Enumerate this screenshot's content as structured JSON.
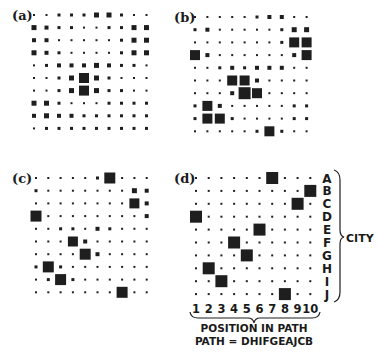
{
  "figure": {
    "panels": [
      {
        "id": "a",
        "label": "(a)",
        "label_pos": [
          12,
          20
        ],
        "origin": [
          34,
          15
        ],
        "step": [
          12.5,
          12.6
        ],
        "sizes": [
          [
            2,
            2,
            3,
            3,
            3,
            5,
            5,
            3,
            2,
            2
          ],
          [
            5,
            4,
            3,
            3,
            2,
            2,
            3,
            3,
            5,
            5
          ],
          [
            4,
            4,
            2,
            2,
            2,
            2,
            2,
            3,
            5,
            5
          ],
          [
            5,
            4,
            3,
            2,
            2,
            2,
            2,
            3,
            5,
            5
          ],
          [
            2,
            3,
            4,
            4,
            4,
            5,
            4,
            3,
            3,
            2
          ],
          [
            2,
            2,
            3,
            5,
            10,
            5,
            3,
            2,
            2,
            2
          ],
          [
            2,
            2,
            3,
            5,
            10,
            5,
            3,
            3,
            2,
            2
          ],
          [
            5,
            5,
            3,
            2,
            2,
            2,
            3,
            3,
            3,
            3
          ],
          [
            4,
            5,
            4,
            4,
            3,
            3,
            3,
            3,
            3,
            3
          ],
          [
            2,
            3,
            3,
            3,
            3,
            3,
            3,
            3,
            3,
            3
          ]
        ]
      },
      {
        "id": "b",
        "label": "(b)",
        "label_pos": [
          174,
          22
        ],
        "origin": [
          195,
          17
        ],
        "step": [
          12.4,
          12.7
        ],
        "sizes": [
          [
            2,
            2,
            2,
            2,
            2,
            3,
            4,
            4,
            2,
            2
          ],
          [
            3,
            4,
            2,
            2,
            2,
            2,
            2,
            3,
            5,
            5
          ],
          [
            2,
            2,
            2,
            2,
            2,
            2,
            2,
            3,
            10,
            10
          ],
          [
            10,
            4,
            2,
            2,
            2,
            2,
            2,
            2,
            4,
            10
          ],
          [
            2,
            2,
            3,
            4,
            3,
            4,
            4,
            4,
            2,
            2
          ],
          [
            2,
            2,
            2,
            10,
            10,
            4,
            2,
            2,
            2,
            2
          ],
          [
            2,
            2,
            2,
            4,
            12,
            10,
            2,
            2,
            2,
            2
          ],
          [
            3,
            10,
            4,
            2,
            2,
            2,
            2,
            2,
            3,
            3
          ],
          [
            3,
            10,
            10,
            3,
            2,
            2,
            2,
            2,
            3,
            3
          ],
          [
            2,
            2,
            2,
            2,
            2,
            3,
            10,
            3,
            2,
            2
          ]
        ]
      },
      {
        "id": "c",
        "label": "(c)",
        "label_pos": [
          12,
          183
        ],
        "origin": [
          36,
          178
        ],
        "step": [
          12.3,
          12.7
        ],
        "sizes": [
          [
            2,
            2,
            2,
            2,
            2,
            3,
            11,
            2,
            2,
            2
          ],
          [
            3,
            2,
            2,
            2,
            2,
            2,
            2,
            2,
            5,
            4
          ],
          [
            2,
            2,
            2,
            2,
            2,
            2,
            2,
            2,
            10,
            4
          ],
          [
            11,
            2,
            2,
            2,
            2,
            2,
            2,
            2,
            2,
            4
          ],
          [
            2,
            2,
            3,
            3,
            2,
            4,
            3,
            2,
            2,
            2
          ],
          [
            2,
            2,
            2,
            10,
            4,
            2,
            2,
            2,
            2,
            2
          ],
          [
            2,
            2,
            2,
            2,
            11,
            4,
            2,
            2,
            2,
            2
          ],
          [
            3,
            11,
            3,
            2,
            2,
            2,
            2,
            2,
            2,
            2
          ],
          [
            2,
            3,
            11,
            3,
            2,
            2,
            2,
            2,
            2,
            2
          ],
          [
            2,
            2,
            2,
            2,
            2,
            2,
            2,
            11,
            2,
            2
          ]
        ]
      },
      {
        "id": "d",
        "label": "(d)",
        "label_pos": [
          174,
          183
        ],
        "origin": [
          196,
          178
        ],
        "step": [
          12.7,
          12.9
        ],
        "sizes": [
          [
            2,
            2,
            2,
            2,
            2,
            2,
            12,
            2,
            2,
            2
          ],
          [
            2,
            2,
            2,
            2,
            2,
            2,
            2,
            2,
            2,
            12
          ],
          [
            2,
            2,
            2,
            2,
            2,
            2,
            2,
            2,
            12,
            2
          ],
          [
            12,
            2,
            2,
            2,
            2,
            2,
            2,
            2,
            2,
            2
          ],
          [
            2,
            2,
            2,
            2,
            2,
            12,
            2,
            2,
            2,
            2
          ],
          [
            2,
            2,
            2,
            12,
            2,
            2,
            2,
            2,
            2,
            2
          ],
          [
            2,
            2,
            2,
            2,
            12,
            2,
            2,
            2,
            2,
            2
          ],
          [
            2,
            12,
            2,
            2,
            2,
            2,
            2,
            2,
            2,
            2
          ],
          [
            2,
            2,
            12,
            2,
            2,
            2,
            2,
            2,
            2,
            2
          ],
          [
            2,
            2,
            2,
            2,
            2,
            2,
            2,
            12,
            2,
            2
          ]
        ]
      }
    ],
    "panel_d_axes": {
      "city_labels": [
        "A",
        "B",
        "C",
        "D",
        "E",
        "F",
        "G",
        "H",
        "I",
        "J"
      ],
      "city_axis_title": "CITY",
      "position_labels": [
        "1",
        "2",
        "3",
        "4",
        "5",
        "6",
        "7",
        "8",
        "9",
        "10"
      ],
      "position_axis_title": "POSITION IN PATH",
      "path_caption": "PATH = DHIFGEAJCB"
    },
    "colors": {
      "ink": "#1e1e1e",
      "background": "#ffffff"
    }
  }
}
